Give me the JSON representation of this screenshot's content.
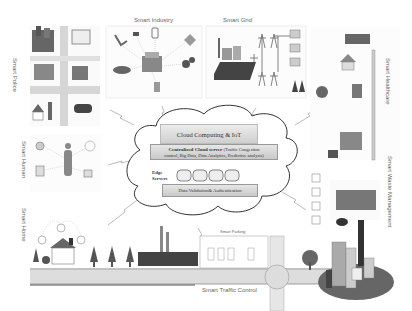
{
  "diagram": {
    "center": {
      "cloud_title": "Cloud Computing & IoT",
      "central_server_bold": "Centralized Cloud server",
      "central_server_detail_1": "(Traffic Congestion",
      "central_server_detail_2": "control, Big Data, Data Analytics, Predictive analysis)",
      "edge_label_1": "Edge",
      "edge_label_2": "Servers",
      "edge_server_count": 4,
      "validation": "Data Validation& Authentication"
    },
    "domains": {
      "smart_industry": "Smart Industry",
      "smart_grid": "Smart Grid",
      "smart_police": "Smart Police",
      "smart_healthcare": "Smart Healthcare",
      "smart_human": "Smart Human",
      "smart_home": "Smart Home",
      "smart_waste": "Smart Waste Management",
      "smart_parking": "Smart Parking",
      "smart_traffic": "Smart Traffic Control"
    },
    "colors": {
      "cloud_box": "#d8d8d8",
      "server_box": "#cfcfcf",
      "road": "#d9d9d9",
      "dark_icon": "#4a4a4a",
      "line": "#999999"
    }
  }
}
